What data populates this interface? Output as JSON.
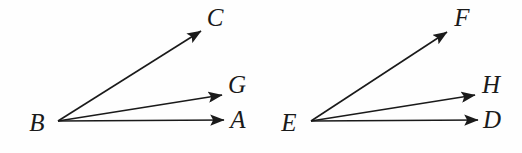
{
  "figure": {
    "background_color": "#fefefe",
    "stroke_color": "#1a1a1a",
    "label_color": "#1a1a1a",
    "stroke_width": 1.6,
    "width": 522,
    "height": 153
  },
  "diagrams": [
    {
      "name": "left-angle-figure",
      "vertex": {
        "label": "B",
        "x": 58,
        "y": 121,
        "label_x": 37,
        "label_y": 131
      },
      "rays": [
        {
          "name": "ray-BC",
          "label": "C",
          "from_x": 58,
          "from_y": 121,
          "to_x": 201,
          "to_y": 31,
          "label_x": 215,
          "label_y": 26
        },
        {
          "name": "ray-BG",
          "label": "G",
          "from_x": 58,
          "from_y": 121,
          "to_x": 222,
          "to_y": 95,
          "label_x": 237,
          "label_y": 93
        },
        {
          "name": "ray-BA",
          "label": "A",
          "from_x": 58,
          "from_y": 121,
          "to_x": 224,
          "to_y": 120,
          "label_x": 238,
          "label_y": 128
        }
      ]
    },
    {
      "name": "right-angle-figure",
      "vertex": {
        "label": "E",
        "x": 311,
        "y": 121,
        "label_x": 289,
        "label_y": 131
      },
      "rays": [
        {
          "name": "ray-EF",
          "label": "F",
          "from_x": 311,
          "from_y": 121,
          "to_x": 447,
          "to_y": 32,
          "label_x": 462,
          "label_y": 26
        },
        {
          "name": "ray-EH",
          "label": "H",
          "from_x": 311,
          "from_y": 121,
          "to_x": 475,
          "to_y": 95,
          "label_x": 491,
          "label_y": 93
        },
        {
          "name": "ray-ED",
          "label": "D",
          "from_x": 311,
          "from_y": 121,
          "to_x": 478,
          "to_y": 120,
          "label_x": 492,
          "label_y": 128
        }
      ]
    }
  ]
}
